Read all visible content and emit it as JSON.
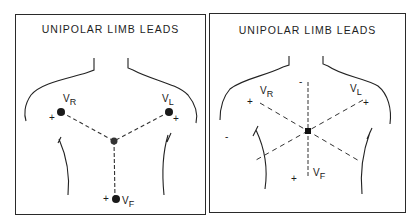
{
  "figure": {
    "panels": [
      {
        "title": "UNIPOLAR LIMB LEADS",
        "leads": [
          {
            "name": "V",
            "sub": "R",
            "polarity": "+"
          },
          {
            "name": "V",
            "sub": "L",
            "polarity": "+"
          },
          {
            "name": "V",
            "sub": "F",
            "polarity": "+"
          }
        ]
      },
      {
        "title": "UNIPOLAR LIMB LEADS",
        "leads": [
          {
            "name": "V",
            "sub": "R",
            "polarity": "+",
            "negative": "-"
          },
          {
            "name": "V",
            "sub": "L",
            "polarity": "+",
            "negative": "-"
          },
          {
            "name": "V",
            "sub": "F",
            "polarity": "+",
            "negative": "-"
          }
        ]
      }
    ],
    "colors": {
      "ink": "#1e1e1e",
      "background": "#ffffff"
    }
  }
}
